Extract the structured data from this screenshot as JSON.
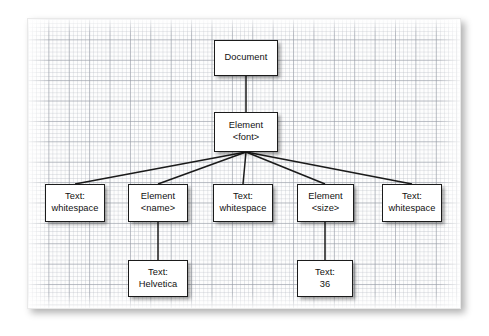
{
  "diagram": {
    "background": {
      "paper_color": "#fdfdfd",
      "grid_minor_color": "#babec6",
      "grid_major_color": "#969baa",
      "page_color": "#ffffff"
    },
    "node_style": {
      "fill": "#ffffff",
      "stroke": "#1b1b1b",
      "text_color": "#111111"
    },
    "edge_color": "#1b1b1b",
    "nodes": [
      {
        "id": "document",
        "line1": "Document",
        "line2": "",
        "x": 214,
        "y": 40,
        "w": 64,
        "h": 36
      },
      {
        "id": "element-font",
        "line1": "Element",
        "line2": "<font>",
        "x": 214,
        "y": 112,
        "w": 64,
        "h": 40
      },
      {
        "id": "text-whitespace-1",
        "line1": "Text:",
        "line2": "whitespace",
        "x": 45,
        "y": 184,
        "w": 60,
        "h": 38
      },
      {
        "id": "element-name",
        "line1": "Element",
        "line2": "<name>",
        "x": 128,
        "y": 184,
        "w": 60,
        "h": 38
      },
      {
        "id": "text-whitespace-2",
        "line1": "Text:",
        "line2": "whitespace",
        "x": 213,
        "y": 184,
        "w": 60,
        "h": 38
      },
      {
        "id": "element-size",
        "line1": "Element",
        "line2": "<size>",
        "x": 297,
        "y": 184,
        "w": 57,
        "h": 38
      },
      {
        "id": "text-whitespace-3",
        "line1": "Text:",
        "line2": "whitespace",
        "x": 382,
        "y": 184,
        "w": 60,
        "h": 38
      },
      {
        "id": "text-helvetica",
        "line1": "Text:",
        "line2": "Helvetica",
        "x": 128,
        "y": 260,
        "w": 60,
        "h": 37
      },
      {
        "id": "text-36",
        "line1": "Text:",
        "line2": "36",
        "x": 297,
        "y": 260,
        "w": 56,
        "h": 37
      }
    ],
    "edges": [
      {
        "id": "document-to-element-font",
        "from": "document",
        "to": "element-font",
        "x1": 246,
        "y1": 76,
        "x2": 246,
        "y2": 112
      },
      {
        "id": "element-font-to-whitespace-1",
        "from": "element-font",
        "to": "text-whitespace-1",
        "x1": 246,
        "y1": 152,
        "x2": 75,
        "y2": 184
      },
      {
        "id": "element-font-to-element-name",
        "from": "element-font",
        "to": "element-name",
        "x1": 246,
        "y1": 152,
        "x2": 158,
        "y2": 184
      },
      {
        "id": "element-font-to-whitespace-2",
        "from": "element-font",
        "to": "text-whitespace-2",
        "x1": 246,
        "y1": 152,
        "x2": 243,
        "y2": 184
      },
      {
        "id": "element-font-to-element-size",
        "from": "element-font",
        "to": "element-size",
        "x1": 246,
        "y1": 152,
        "x2": 325,
        "y2": 184
      },
      {
        "id": "element-font-to-whitespace-3",
        "from": "element-font",
        "to": "text-whitespace-3",
        "x1": 246,
        "y1": 152,
        "x2": 412,
        "y2": 184
      },
      {
        "id": "element-name-to-text-helvetica",
        "from": "element-name",
        "to": "text-helvetica",
        "x1": 158,
        "y1": 222,
        "x2": 158,
        "y2": 260
      },
      {
        "id": "element-size-to-text-36",
        "from": "element-size",
        "to": "text-36",
        "x1": 325,
        "y1": 222,
        "x2": 325,
        "y2": 260
      }
    ]
  }
}
